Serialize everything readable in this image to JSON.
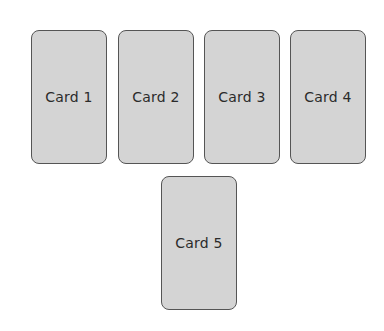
{
  "cards": [
    {
      "label": "Card 1"
    },
    {
      "label": "Card 2"
    },
    {
      "label": "Card 3"
    },
    {
      "label": "Card 4"
    },
    {
      "label": "Card 5"
    }
  ],
  "colors": {
    "card_fill": "#d4d4d4",
    "card_border": "#555555",
    "text": "#2b2b2b",
    "background": "#ffffff"
  }
}
